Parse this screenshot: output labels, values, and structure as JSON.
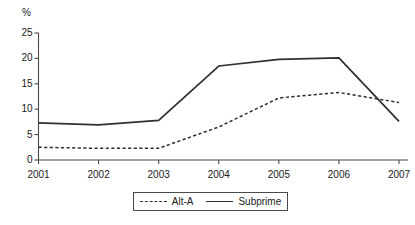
{
  "chart_data": {
    "type": "line",
    "title": "",
    "subtitle": "",
    "xlabel": "",
    "ylabel": "%",
    "unit_label": "%",
    "categories": [
      "2001",
      "2002",
      "2003",
      "2004",
      "2005",
      "2006",
      "2007"
    ],
    "x": [
      2001,
      2002,
      2003,
      2004,
      2005,
      2006,
      2007
    ],
    "xlim": [
      2001,
      2007
    ],
    "ylim": [
      0,
      25
    ],
    "yticks": [
      0,
      5,
      10,
      15,
      20,
      25
    ],
    "ytick_labels": [
      "0",
      "5",
      "10",
      "15",
      "20",
      "25"
    ],
    "xtick_labels": [
      "2001",
      "2002",
      "2003",
      "2004",
      "2005",
      "2006",
      "2007"
    ],
    "grid": false,
    "legend_position": "bottom-center",
    "series": [
      {
        "name": "Alt-A",
        "style": "dashed",
        "color": "#2f2f2f",
        "values": [
          2.5,
          2.3,
          2.3,
          6.5,
          12.2,
          13.3,
          11.3
        ]
      },
      {
        "name": "Subprime",
        "style": "solid",
        "color": "#2f2f2f",
        "values": [
          7.3,
          6.9,
          7.8,
          18.5,
          19.8,
          20.1,
          7.6
        ]
      }
    ],
    "annotations": []
  },
  "legend": {
    "items": [
      {
        "label": "Alt-A",
        "style": "dashed"
      },
      {
        "label": "Subprime",
        "style": "solid"
      }
    ]
  },
  "colors": {
    "line": "#2f2f2f",
    "axis": "#4a4a4a",
    "text": "#1a1a1a",
    "background": "#ffffff"
  }
}
